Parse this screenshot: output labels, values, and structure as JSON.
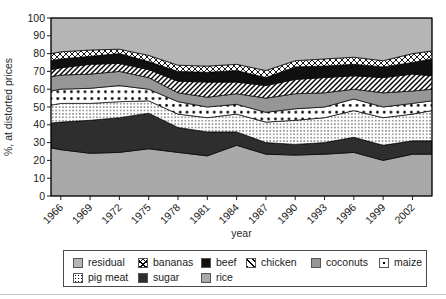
{
  "chart": {
    "ylabel": "%, at distorted prices",
    "xlabel": "year"
  },
  "chart_data": {
    "type": "area",
    "stacked": true,
    "title": "",
    "ylabel": "%, at distorted prices",
    "xlabel": "year",
    "ylim": [
      0,
      100
    ],
    "xlim": [
      1965,
      2004
    ],
    "y_ticks": [
      0,
      10,
      20,
      30,
      40,
      50,
      60,
      70,
      80,
      90,
      100
    ],
    "x_ticks": [
      1966,
      1969,
      1972,
      1975,
      1978,
      1981,
      1984,
      1987,
      1990,
      1993,
      1996,
      1999,
      2002
    ],
    "grid": false,
    "legend_position": "bottom",
    "x": [
      1965,
      1966,
      1969,
      1972,
      1975,
      1978,
      1981,
      1984,
      1987,
      1990,
      1993,
      1996,
      1999,
      2002,
      2004
    ],
    "series": [
      {
        "name": "rice",
        "key": "rice",
        "fill": "solid",
        "color": "#a9a9a9",
        "values": [
          27,
          26,
          24,
          24.5,
          26.5,
          24.5,
          22.5,
          28.5,
          23.5,
          23,
          23.5,
          24.5,
          20,
          23.5,
          23.5
        ]
      },
      {
        "name": "sugar",
        "key": "sugar",
        "fill": "solid",
        "color": "#2e2e2e",
        "values": [
          14,
          15.5,
          18.5,
          19.5,
          20,
          14,
          13.5,
          7.5,
          6.5,
          6,
          6.5,
          8.5,
          8.5,
          7.5,
          7.5
        ]
      },
      {
        "name": "pig meat",
        "key": "pig_meat",
        "fill": "dots-fine",
        "color": "#ffffff",
        "values": [
          10,
          10.5,
          9.5,
          9,
          7,
          7.5,
          8,
          10,
          11.5,
          13.5,
          14,
          15,
          15.5,
          15,
          17
        ]
      },
      {
        "name": "maize",
        "key": "maize",
        "fill": "dots-coarse",
        "color": "#ffffff",
        "values": [
          8,
          8,
          8.5,
          9,
          6.5,
          7,
          6,
          5.5,
          5.5,
          6.5,
          6,
          6.5,
          6,
          6,
          5.5
        ]
      },
      {
        "name": "coconuts",
        "key": "coconuts",
        "fill": "solid",
        "color": "#969696",
        "values": [
          8,
          8,
          8,
          8,
          6.5,
          5,
          5.5,
          6,
          8,
          8.5,
          8,
          5.5,
          8,
          7,
          6.5
        ]
      },
      {
        "name": "chicken",
        "key": "chicken",
        "fill": "diagonal",
        "color": "#ffffff",
        "values": [
          4,
          4,
          5.5,
          4.5,
          4.5,
          6.5,
          8.5,
          6.5,
          7,
          8,
          8.5,
          7.5,
          8.5,
          9.5,
          7.5
        ]
      },
      {
        "name": "beef",
        "key": "beef",
        "fill": "solid",
        "color": "#101010",
        "values": [
          5,
          5,
          4.5,
          5.5,
          4.5,
          5.5,
          5.5,
          6.5,
          4.5,
          7,
          6.5,
          6.5,
          6,
          6.5,
          9.5
        ]
      },
      {
        "name": "bananas",
        "key": "bananas",
        "fill": "crosshatch",
        "color": "#ffffff",
        "values": [
          4,
          4,
          3.5,
          2.5,
          3.5,
          3.5,
          3.5,
          3.5,
          4,
          3.5,
          4,
          4,
          3.5,
          5,
          4.5
        ]
      },
      {
        "name": "residual",
        "key": "residual",
        "fill": "solid",
        "color": "#b5b5b5",
        "values": [
          20,
          19,
          18,
          17.5,
          21,
          26.5,
          27,
          26,
          29.5,
          24,
          23,
          22,
          24,
          20,
          18.5
        ]
      }
    ],
    "colors": {
      "residual": "#b5b5b5",
      "rice": "#a9a9a9",
      "coconuts": "#969696",
      "sugar": "#2e2e2e",
      "beef": "#101010",
      "pattern_mark": "#000000",
      "pattern_bg": "#ffffff",
      "axis": "#1a1a1a"
    }
  },
  "legend": {
    "items": [
      {
        "label": "residual",
        "key": "residual"
      },
      {
        "label": "bananas",
        "key": "bananas"
      },
      {
        "label": "beef",
        "key": "beef"
      },
      {
        "label": "chicken",
        "key": "chicken"
      },
      {
        "label": "coconuts",
        "key": "coconuts"
      },
      {
        "label": "maize",
        "key": "maize"
      },
      {
        "label": "pig meat",
        "key": "pig_meat"
      },
      {
        "label": "sugar",
        "key": "sugar"
      },
      {
        "label": "rice",
        "key": "rice"
      }
    ]
  }
}
